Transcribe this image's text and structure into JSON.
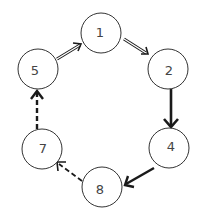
{
  "diagram": {
    "type": "directed-cycle-graph",
    "colors": {
      "stroke": "#1a1a1a",
      "node_stroke": "#333333",
      "label": "#444444",
      "background": "#ffffff"
    },
    "nodes": [
      {
        "id": "1",
        "label": "1",
        "cx": 101,
        "cy": 33,
        "r": 20
      },
      {
        "id": "2",
        "label": "2",
        "cx": 168,
        "cy": 69,
        "r": 20
      },
      {
        "id": "4",
        "label": "4",
        "cx": 169,
        "cy": 148,
        "r": 20
      },
      {
        "id": "8",
        "label": "8",
        "cx": 102,
        "cy": 187,
        "r": 20
      },
      {
        "id": "7",
        "label": "7",
        "cx": 42,
        "cy": 149,
        "r": 20
      },
      {
        "id": "5",
        "label": "5",
        "cx": 38,
        "cy": 69,
        "r": 20
      }
    ],
    "edges": [
      {
        "from": "5",
        "to": "1",
        "style": "double-line"
      },
      {
        "from": "1",
        "to": "2",
        "style": "double-line"
      },
      {
        "from": "2",
        "to": "4",
        "style": "thick-solid"
      },
      {
        "from": "4",
        "to": "8",
        "style": "thick-solid"
      },
      {
        "from": "8",
        "to": "7",
        "style": "dashed"
      },
      {
        "from": "7",
        "to": "5",
        "style": "thick-dashed"
      }
    ]
  }
}
